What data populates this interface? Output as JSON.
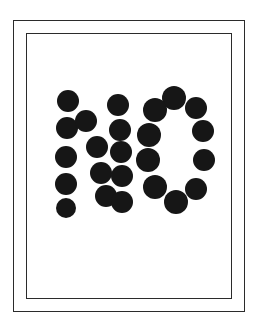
{
  "artwork": {
    "title": "NO",
    "description": "The word NO rendered as a grid of solid black dots inside a double rectangular frame",
    "background_color": "#ffffff",
    "dot_color": "#161616",
    "frame_color": "#2b2b2b",
    "frame_outer": {
      "x": 13,
      "y": 20,
      "width": 232,
      "height": 292,
      "stroke": 1.5
    },
    "frame_inner": {
      "x": 26,
      "y": 33,
      "width": 206,
      "height": 266,
      "stroke": 1.5
    },
    "letters": [
      {
        "glyph": "N",
        "dots": [
          {
            "cx": 68,
            "cy": 101,
            "r": 11
          },
          {
            "cx": 67,
            "cy": 128,
            "r": 11
          },
          {
            "cx": 66,
            "cy": 157,
            "r": 11
          },
          {
            "cx": 66,
            "cy": 184,
            "r": 11
          },
          {
            "cx": 66,
            "cy": 208,
            "r": 10
          },
          {
            "cx": 86,
            "cy": 121,
            "r": 11
          },
          {
            "cx": 97,
            "cy": 147,
            "r": 11
          },
          {
            "cx": 101,
            "cy": 173,
            "r": 11
          },
          {
            "cx": 106,
            "cy": 196,
            "r": 11
          },
          {
            "cx": 118,
            "cy": 105,
            "r": 11
          },
          {
            "cx": 120,
            "cy": 130,
            "r": 11
          },
          {
            "cx": 121,
            "cy": 152,
            "r": 11
          },
          {
            "cx": 122,
            "cy": 176,
            "r": 11
          },
          {
            "cx": 122,
            "cy": 202,
            "r": 11
          }
        ]
      },
      {
        "glyph": "O",
        "dots": [
          {
            "cx": 174,
            "cy": 98,
            "r": 12
          },
          {
            "cx": 155,
            "cy": 110,
            "r": 12
          },
          {
            "cx": 149,
            "cy": 135,
            "r": 12
          },
          {
            "cx": 148,
            "cy": 160,
            "r": 12
          },
          {
            "cx": 155,
            "cy": 187,
            "r": 12
          },
          {
            "cx": 176,
            "cy": 202,
            "r": 12
          },
          {
            "cx": 196,
            "cy": 189,
            "r": 11
          },
          {
            "cx": 204,
            "cy": 160,
            "r": 11
          },
          {
            "cx": 203,
            "cy": 131,
            "r": 11
          },
          {
            "cx": 196,
            "cy": 108,
            "r": 11
          }
        ]
      }
    ]
  }
}
